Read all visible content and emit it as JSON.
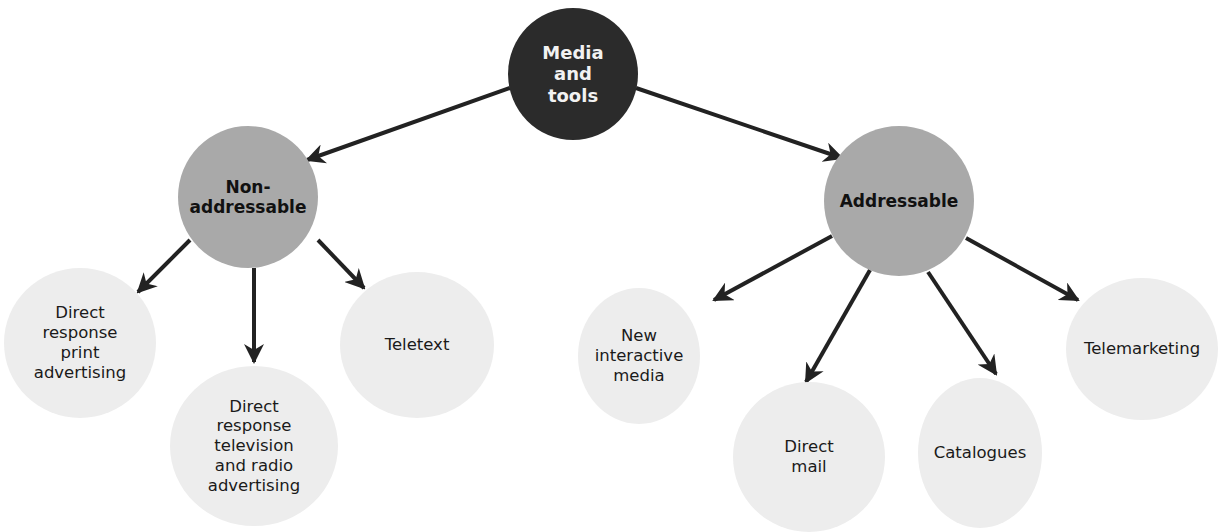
{
  "diagram": {
    "type": "tree",
    "root": {
      "id": "root",
      "label": "Media\nand\ntools",
      "color": "#2b2b2b"
    },
    "branches": [
      {
        "id": "non",
        "label": "Non-\naddressable",
        "color": "#a9a9a9",
        "children": [
          {
            "id": "print",
            "label": "Direct\nresponse\nprint\nadvertising"
          },
          {
            "id": "tv",
            "label": "Direct\nresponse\ntelevision\nand radio\nadvertising"
          },
          {
            "id": "teletext",
            "label": "Teletext"
          }
        ]
      },
      {
        "id": "addr",
        "label": "Addressable",
        "color": "#a9a9a9",
        "children": [
          {
            "id": "nim",
            "label": "New\ninteractive\nmedia"
          },
          {
            "id": "mail",
            "label": "Direct\nmail"
          },
          {
            "id": "cat",
            "label": "Catalogues"
          },
          {
            "id": "tele",
            "label": "Telemarketing"
          }
        ]
      }
    ],
    "leaf_color": "#ededed",
    "arrow_color": "#222222"
  },
  "nodes": {
    "root": "Media\nand\ntools",
    "non": "Non-\naddressable",
    "addr": "Addressable",
    "print": "Direct\nresponse\nprint\nadvertising",
    "tv": "Direct\nresponse\ntelevision\nand radio\nadvertising",
    "teletext": "Teletext",
    "nim": "New\ninteractive\nmedia",
    "mail": "Direct\nmail",
    "cat": "Catalogues",
    "tele": "Telemarketing"
  }
}
